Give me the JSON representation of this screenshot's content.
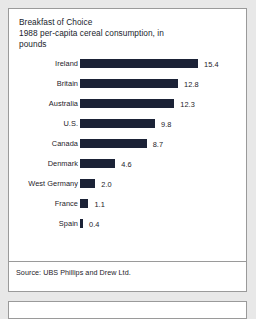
{
  "card": {
    "title_lines": [
      "Breakfast of Choice",
      "1988 per-capita cereal consumption, in",
      "pounds"
    ],
    "source": "Source: UBS Phillips and Drew Ltd."
  },
  "colors": {
    "bar": "#1b2236",
    "text": "#1d2128",
    "card_border": "#9a9a9a",
    "page_background": "#e8e8e8",
    "card_background": "#ffffff"
  },
  "chart_data": {
    "type": "bar",
    "orientation": "horizontal",
    "title": "Breakfast of Choice",
    "subtitle": "1988 per-capita cereal consumption, in pounds",
    "xlabel": "",
    "ylabel": "",
    "unit": "pounds",
    "xlim": [
      0,
      15.4
    ],
    "grid": false,
    "legend": false,
    "data_labels": true,
    "categories": [
      "Ireland",
      "Britain",
      "Australia",
      "U.S.",
      "Canada",
      "Denmark",
      "West Germany",
      "France",
      "Spain"
    ],
    "values": [
      15.4,
      12.8,
      12.3,
      9.8,
      8.7,
      4.6,
      2.0,
      1.1,
      0.4
    ],
    "value_labels": [
      "15.4",
      "12.8",
      "12.3",
      "9.8",
      "8.7",
      "4.6",
      "2.0",
      "1.1",
      "0.4"
    ],
    "source": "Source: UBS Phillips and Drew Ltd."
  }
}
